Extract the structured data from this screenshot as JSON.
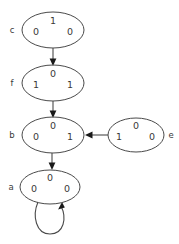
{
  "diagram": {
    "type": "state-transition-graph",
    "background_color": "#ffffff",
    "stroke_color": "#4a4a4a",
    "text_color": "#3a3a3a",
    "nodes": [
      {
        "id": "c",
        "label": "c",
        "label_side": "left",
        "cx": 53,
        "cy": 30,
        "rx": 31,
        "ry": 18,
        "top": "1",
        "left": "0",
        "right": "0"
      },
      {
        "id": "f",
        "label": "f",
        "label_side": "left",
        "cx": 53,
        "cy": 83,
        "rx": 31,
        "ry": 18,
        "top": "0",
        "left": "1",
        "right": "1"
      },
      {
        "id": "b",
        "label": "b",
        "label_side": "left",
        "cx": 53,
        "cy": 135,
        "rx": 31,
        "ry": 18,
        "top": "0",
        "left": "0",
        "right": "1"
      },
      {
        "id": "a",
        "label": "a",
        "label_side": "left",
        "cx": 50,
        "cy": 187,
        "rx": 30,
        "ry": 17,
        "top": "0",
        "left": "0",
        "right": "0"
      },
      {
        "id": "e",
        "label": "e",
        "label_side": "right",
        "cx": 136,
        "cy": 135,
        "rx": 28,
        "ry": 17,
        "top": "0",
        "left": "1",
        "right": "0"
      }
    ],
    "edges": [
      {
        "id": "c-to-f",
        "from": "c",
        "to": "f",
        "direction": "down"
      },
      {
        "id": "f-to-b",
        "from": "f",
        "to": "b",
        "direction": "down"
      },
      {
        "id": "b-to-a",
        "from": "b",
        "to": "a",
        "direction": "down"
      },
      {
        "id": "e-to-b",
        "from": "e",
        "to": "b",
        "direction": "left"
      },
      {
        "id": "a-to-a",
        "from": "a",
        "to": "a",
        "direction": "self-loop"
      }
    ]
  }
}
